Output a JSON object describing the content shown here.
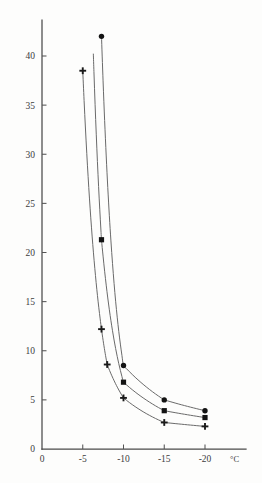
{
  "figure": {
    "background_color": "#fdfdfc",
    "line_color": "#6a6a6a",
    "marker_color": "#131313",
    "axis_color": "#4a4a4a"
  },
  "axes": {
    "x_unit_label": "°C",
    "x_tick_labels": [
      "0",
      "-5",
      "-10",
      "-15",
      "-20"
    ],
    "y_tick_labels": [
      "0",
      "5",
      "10",
      "15",
      "20",
      "25",
      "30",
      "35",
      "40"
    ],
    "origin_label": "0"
  },
  "chart_data": {
    "type": "line",
    "title": "",
    "subtitle": "",
    "xlabel": "°C",
    "ylabel": "",
    "xlim": [
      0,
      -21.5
    ],
    "ylim": [
      0,
      43
    ],
    "x_ticks": [
      0,
      -5,
      -10,
      -15,
      -20
    ],
    "y_ticks": [
      0,
      5,
      10,
      15,
      20,
      25,
      30,
      35,
      40
    ],
    "grid": false,
    "legend": false,
    "legend_position": "none",
    "annotations": [],
    "series": [
      {
        "name": "lower-curve",
        "marker": "plus",
        "x": [
          -5.0,
          -7.3,
          -8.0,
          -10.0,
          -15.0,
          -20.0
        ],
        "y": [
          38.5,
          12.2,
          8.6,
          5.2,
          2.7,
          2.3
        ],
        "marker_x": [
          -5.0,
          -7.3,
          -8.0,
          -10.0,
          -15.0,
          -20.0
        ],
        "marker_y": [
          38.5,
          12.2,
          8.6,
          5.2,
          2.7,
          2.3
        ]
      },
      {
        "name": "middle-curve",
        "marker": "square",
        "x": [
          -6.3,
          -7.3,
          -10.0,
          -15.0,
          -20.0
        ],
        "y": [
          40.2,
          21.3,
          6.8,
          3.9,
          3.2
        ],
        "marker_x": [
          -7.3,
          -10.0,
          -15.0,
          -20.0
        ],
        "marker_y": [
          21.3,
          6.8,
          3.9,
          3.2
        ]
      },
      {
        "name": "upper-curve",
        "marker": "circle",
        "x": [
          -7.3,
          -10.0,
          -15.0,
          -20.0
        ],
        "y": [
          42.0,
          8.5,
          5.0,
          3.9
        ],
        "marker_x": [
          -7.3,
          -10.0,
          -15.0,
          -20.0
        ],
        "marker_y": [
          42.0,
          8.5,
          5.0,
          3.9
        ]
      }
    ]
  }
}
